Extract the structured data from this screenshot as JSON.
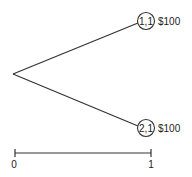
{
  "tree": {
    "root": {
      "x": 13,
      "y": 74
    },
    "nodes": [
      {
        "id": "1,1",
        "label": "1,1",
        "payoff": "$100",
        "cx": 146,
        "cy": 21
      },
      {
        "id": "2,1",
        "label": "2,1",
        "payoff": "$100",
        "cx": 146,
        "cy": 128
      }
    ]
  },
  "scale": {
    "start_label": "0",
    "end_label": "1"
  },
  "colors": {
    "line": "#333333",
    "text": "#222222"
  }
}
